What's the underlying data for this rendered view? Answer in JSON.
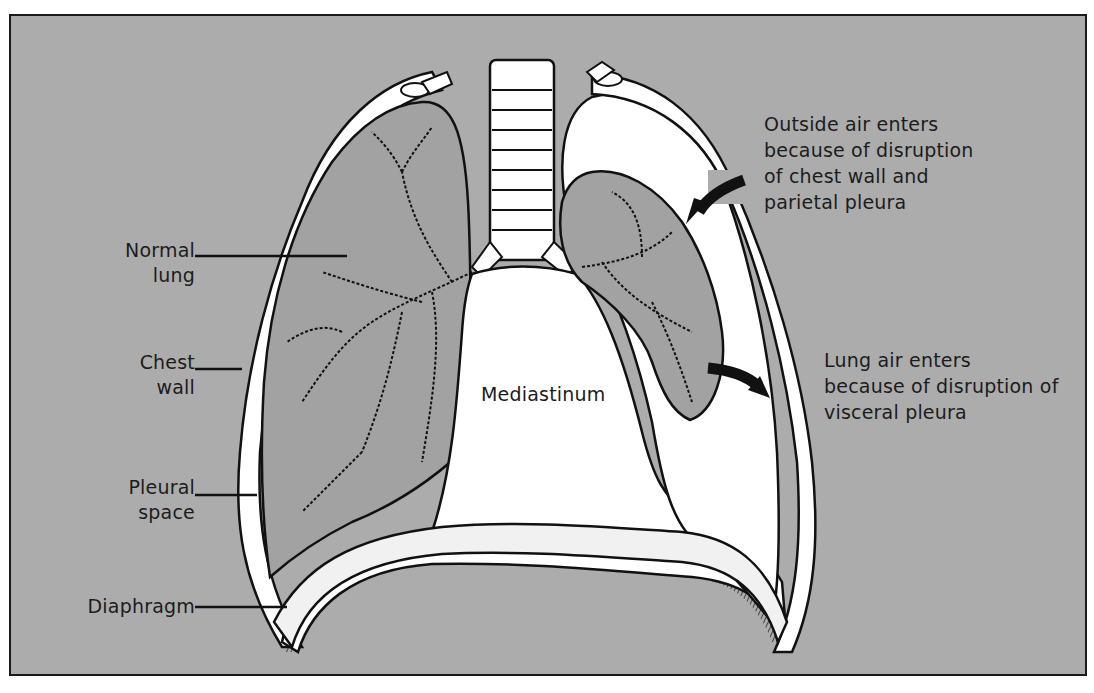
{
  "figure": {
    "colors": {
      "background": "#acacac",
      "frame": "#1a1a1a",
      "tissue_fill": "#ffffff",
      "lung_fill": "#9c9c9c",
      "line": "#111111",
      "text": "#1c1c1c"
    }
  },
  "labels": {
    "normal_lung": [
      "Normal",
      "lung"
    ],
    "chest_wall": [
      "Chest",
      "wall"
    ],
    "pleural_space": [
      "Pleural",
      "space"
    ],
    "diaphragm": [
      "Diaphragm"
    ],
    "mediastinum": [
      "Mediastinum"
    ],
    "outside_air": [
      "Outside air enters",
      "because of disruption",
      "of chest wall and",
      "parietal pleura"
    ],
    "lung_air": [
      "Lung air enters",
      "because of disruption of",
      "visceral pleura"
    ]
  }
}
